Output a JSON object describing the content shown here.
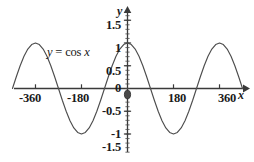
{
  "figure": {
    "kind": "cartesian-plot",
    "background": "#ffffff",
    "ink": "#333333",
    "width": 254,
    "height": 162
  },
  "annotation": {
    "equation_y": "y",
    "equation_eq": "=",
    "equation_fn": "cos",
    "equation_arg": "x",
    "equation_full": "y = cos x"
  },
  "axes": {
    "x_name": "x",
    "y_name": "y",
    "x_ticks": [
      "-360",
      "-180",
      "180",
      "360"
    ],
    "x_tick_values": [
      -360,
      -180,
      180,
      360
    ],
    "y_ticks": [
      "1.5",
      "1",
      "0.5",
      "0",
      "-0.5",
      "-1",
      "-1.5"
    ],
    "y_tick_values": [
      1.5,
      1,
      0.5,
      0,
      -0.5,
      -1,
      -1.5
    ],
    "origin_label": "0",
    "x_arrow": "arrow-right",
    "y_arrow": "arrow-up",
    "origin_marker": "origin-dot"
  },
  "chart_data": {
    "type": "line",
    "title": "",
    "xlabel": "x",
    "ylabel": "y",
    "function": "y = cos x",
    "angle_unit": "degrees",
    "amplitude": 1,
    "period": 360,
    "xlim": [
      -450,
      450
    ],
    "ylim": [
      -1.6,
      1.7
    ],
    "grid": false,
    "legend": "none",
    "annotation_text": "y = cos x",
    "series": [
      {
        "name": "y = cos x",
        "x": [
          -450,
          -435,
          -420,
          -405,
          -390,
          -375,
          -360,
          -345,
          -330,
          -315,
          -300,
          -285,
          -270,
          -255,
          -240,
          -225,
          -210,
          -195,
          -180,
          -165,
          -150,
          -135,
          -120,
          -105,
          -90,
          -75,
          -60,
          -45,
          -30,
          -15,
          0,
          15,
          30,
          45,
          60,
          75,
          90,
          105,
          120,
          135,
          150,
          165,
          180,
          195,
          210,
          225,
          240,
          255,
          270,
          285,
          300,
          315,
          330,
          345,
          360,
          375,
          390,
          405,
          420,
          435,
          450
        ],
        "y": [
          0,
          0.259,
          0.5,
          0.707,
          0.866,
          0.966,
          1,
          0.966,
          0.866,
          0.707,
          0.5,
          0.259,
          0,
          -0.259,
          -0.5,
          -0.707,
          -0.866,
          -0.966,
          -1,
          -0.966,
          -0.866,
          -0.707,
          -0.5,
          -0.259,
          0,
          0.259,
          0.5,
          0.707,
          0.866,
          0.966,
          1,
          0.966,
          0.866,
          0.707,
          0.5,
          0.259,
          0,
          -0.259,
          -0.5,
          -0.707,
          -0.866,
          -0.966,
          -1,
          -0.966,
          -0.866,
          -0.707,
          -0.5,
          -0.259,
          0,
          0.259,
          0.5,
          0.707,
          0.866,
          0.966,
          1,
          0.966,
          0.866,
          0.707,
          0.5,
          0.259,
          0
        ]
      }
    ],
    "key_points": {
      "maxima_x": [
        0,
        360,
        -360
      ],
      "maxima_y": 1,
      "minima_x": [
        180,
        -180
      ],
      "minima_y": -1,
      "zeros_x": [
        -450,
        -270,
        -90,
        90,
        270,
        450
      ]
    }
  }
}
